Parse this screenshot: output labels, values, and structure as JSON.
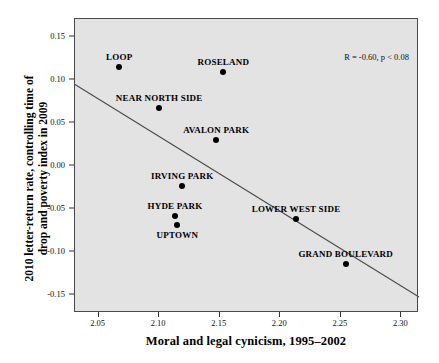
{
  "chart_data": {
    "type": "scatter",
    "title": "",
    "xlabel": "Moral and legal cynicism, 1995–2002",
    "ylabel_lines": [
      "2010 letter-return rate, controlling time of",
      "drop and poverty index in 2009"
    ],
    "xlim": [
      2.0305,
      2.3145
    ],
    "ylim": [
      -0.1705,
      0.1705
    ],
    "xticks": [
      "2.05",
      "2.10",
      "2.15",
      "2.20",
      "2.25",
      "2.30"
    ],
    "xtick_values": [
      2.05,
      2.1,
      2.15,
      2.2,
      2.25,
      2.3
    ],
    "yticks": [
      "0.15",
      "0.10",
      "0.05",
      "0.00",
      "-0.05",
      "-0.10",
      "-0.15"
    ],
    "ytick_values": [
      0.15,
      0.1,
      0.05,
      0.0,
      -0.05,
      -0.1,
      -0.15
    ],
    "grid": false,
    "legend": "none",
    "annotation": "R = -0.60, p < 0.08",
    "annotation_r": -0.6,
    "annotation_p": 0.08,
    "plot_background": "#e3e3e3",
    "point_color": "#000000",
    "trendline_color": "#4a4a4a",
    "points": [
      {
        "label": "LOOP",
        "x": 2.067,
        "y": 0.115,
        "label_pos": "above"
      },
      {
        "label": "ROSELAND",
        "x": 2.153,
        "y": 0.109,
        "label_pos": "above"
      },
      {
        "label": "NEAR NORTH SIDE",
        "x": 2.1,
        "y": 0.067,
        "label_pos": "above"
      },
      {
        "label": "AVALON PARK",
        "x": 2.147,
        "y": 0.03,
        "label_pos": "above"
      },
      {
        "label": "IRVING PARK",
        "x": 2.119,
        "y": -0.023,
        "label_pos": "above"
      },
      {
        "label": "HYDE PARK",
        "x": 2.113,
        "y": -0.058,
        "label_pos": "above"
      },
      {
        "label": "UPTOWN",
        "x": 2.115,
        "y": -0.068,
        "label_pos": "below"
      },
      {
        "label": "LOWER WEST SIDE",
        "x": 2.213,
        "y": -0.062,
        "label_pos": "above"
      },
      {
        "label": "GRAND BOULEVARD",
        "x": 2.254,
        "y": -0.114,
        "label_pos": "above"
      }
    ],
    "trendline": {
      "x0": 2.0305,
      "y0": 0.0945,
      "x1": 2.3145,
      "y1": -0.152
    }
  }
}
